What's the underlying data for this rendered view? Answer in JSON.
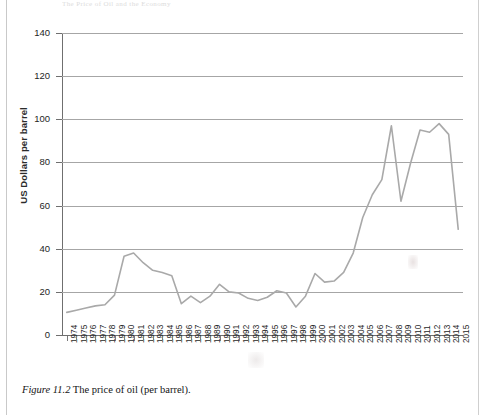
{
  "document": {
    "running_head": "The Price of Oil and the Economy",
    "caption_figure": "Figure 11.2",
    "caption_text": "The price of oil (per barrel)."
  },
  "chart_data": {
    "type": "line",
    "title": "",
    "xlabel": "",
    "ylabel": "US Dollars per barrel",
    "ylim": [
      0,
      140
    ],
    "yticks": [
      0,
      20,
      40,
      60,
      80,
      100,
      120,
      140
    ],
    "grid": true,
    "legend": "none",
    "line_color": "#a9a9a9",
    "categories": [
      "1974",
      "1975",
      "1976",
      "1977",
      "1978",
      "1979",
      "1980",
      "1981",
      "1982",
      "1983",
      "1984",
      "1985",
      "1986",
      "1987",
      "1988",
      "1989",
      "1990",
      "1991",
      "1992",
      "1993",
      "1994",
      "1995",
      "1996",
      "1997",
      "1998",
      "1999",
      "2000",
      "2001",
      "2002",
      "2003",
      "2004",
      "2005",
      "2006",
      "2007",
      "2008",
      "2009",
      "2010",
      "2011",
      "2012",
      "2013",
      "2014",
      "2015"
    ],
    "values": [
      10.5,
      11.5,
      12.5,
      13.5,
      14.0,
      18.5,
      36.5,
      38.0,
      33.5,
      30.0,
      29.0,
      27.5,
      14.5,
      18.0,
      15.0,
      18.0,
      23.5,
      20.0,
      19.5,
      17.0,
      16.0,
      17.5,
      20.5,
      19.5,
      13.0,
      18.0,
      28.5,
      24.5,
      25.0,
      29.0,
      38.0,
      54.5,
      65.0,
      72.0,
      97.0,
      62.0,
      79.5,
      95.0,
      94.0,
      98.0,
      93.0,
      49.0
    ]
  }
}
